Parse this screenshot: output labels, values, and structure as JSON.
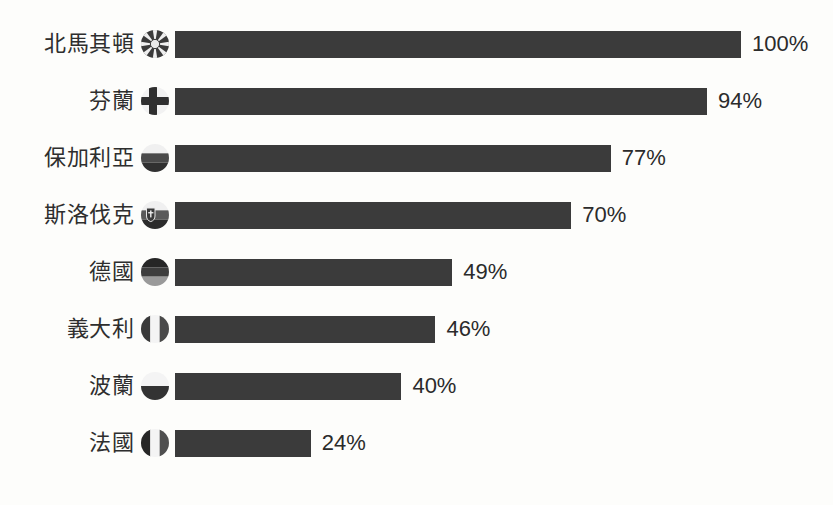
{
  "chart_data": {
    "type": "bar",
    "orientation": "horizontal",
    "title": "",
    "subtitle": "",
    "xlabel": "",
    "ylabel": "",
    "xlim": [
      0,
      100
    ],
    "grid": false,
    "legend": null,
    "value_suffix": "%",
    "bar_color": "#3b3b3b",
    "background_color": "#fdfdfb",
    "label_color": "#2e2e2e",
    "categories": [
      "北馬其頓",
      "芬蘭",
      "保加利亞",
      "斯洛伐克",
      "德國",
      "義大利",
      "波蘭",
      "法國"
    ],
    "values": [
      100,
      94,
      77,
      70,
      49,
      46,
      40,
      24
    ],
    "value_labels": [
      "100%",
      "94%",
      "77%",
      "70%",
      "49%",
      "46%",
      "40%",
      "24%"
    ],
    "rows": [
      {
        "label": "北馬其頓",
        "value": 100,
        "value_label": "100%",
        "flag": "north-macedonia-flag-icon"
      },
      {
        "label": "芬蘭",
        "value": 94,
        "value_label": "94%",
        "flag": "finland-flag-icon"
      },
      {
        "label": "保加利亞",
        "value": 77,
        "value_label": "77%",
        "flag": "bulgaria-flag-icon"
      },
      {
        "label": "斯洛伐克",
        "value": 70,
        "value_label": "70%",
        "flag": "slovakia-flag-icon"
      },
      {
        "label": "德國",
        "value": 49,
        "value_label": "49%",
        "flag": "germany-flag-icon"
      },
      {
        "label": "義大利",
        "value": 46,
        "value_label": "46%",
        "flag": "italy-flag-icon"
      },
      {
        "label": "波蘭",
        "value": 40,
        "value_label": "40%",
        "flag": "poland-flag-icon"
      },
      {
        "label": "法國",
        "value": 24,
        "value_label": "24%",
        "flag": "france-flag-icon"
      }
    ]
  },
  "layout": {
    "bar_origin_x": 175,
    "px_per_percent": 5.66,
    "row_start_y": 22,
    "row_spacing": 57
  }
}
